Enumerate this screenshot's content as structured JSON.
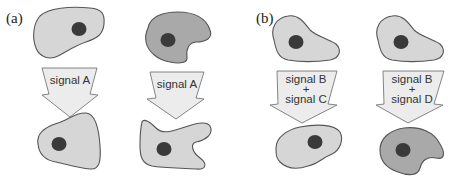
{
  "figure": {
    "panels": [
      {
        "label": "(a)",
        "columns": [
          {
            "before_cell": {
              "shade": "light",
              "color": "#d6d6d6"
            },
            "signal": {
              "lines": [
                "signal A"
              ]
            },
            "after_cell": {
              "shade": "light",
              "color": "#d6d6d6",
              "shape": "changed"
            }
          },
          {
            "before_cell": {
              "shade": "dark",
              "color": "#a9a9a9"
            },
            "signal": {
              "lines": [
                "signal A"
              ]
            },
            "after_cell": {
              "shade": "light",
              "color": "#d6d6d6",
              "shape": "changed"
            }
          }
        ]
      },
      {
        "label": "(b)",
        "columns": [
          {
            "before_cell": {
              "shade": "light",
              "color": "#d6d6d6"
            },
            "signal": {
              "lines": [
                "signal B",
                "+",
                "signal C"
              ]
            },
            "after_cell": {
              "shade": "light",
              "color": "#d6d6d6"
            }
          },
          {
            "before_cell": {
              "shade": "light",
              "color": "#d6d6d6"
            },
            "signal": {
              "lines": [
                "signal B",
                "+",
                "signal D"
              ]
            },
            "after_cell": {
              "shade": "dark",
              "color": "#a9a9a9"
            }
          }
        ]
      }
    ]
  },
  "colors": {
    "nucleus": "#3a3a3a",
    "cell_outline": "#555555",
    "arrow_fill": "#ececec"
  }
}
